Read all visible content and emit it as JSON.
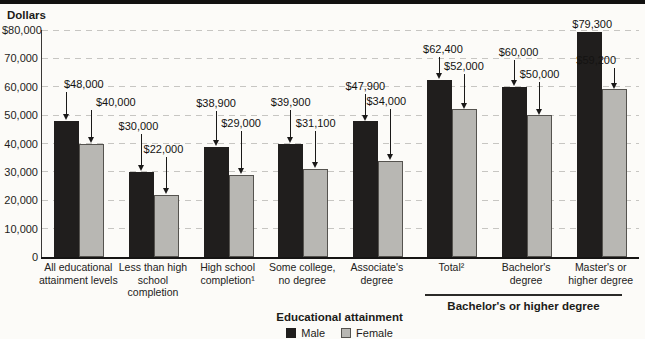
{
  "chart_data": {
    "type": "bar",
    "title": "",
    "ylabel": "Dollars",
    "xlabel": "Educational attainment",
    "ylim": [
      0,
      80000
    ],
    "grid": "horizontal-dashed",
    "legend_position": "bottom",
    "y_ticks": [
      {
        "label": "$80,000",
        "value": 80000
      },
      {
        "label": "70,000",
        "value": 70000
      },
      {
        "label": "60,000",
        "value": 60000
      },
      {
        "label": "50,000",
        "value": 50000
      },
      {
        "label": "40,000",
        "value": 40000
      },
      {
        "label": "30,000",
        "value": 30000
      },
      {
        "label": "20,000",
        "value": 20000
      },
      {
        "label": "10,000",
        "value": 10000
      },
      {
        "label": "0",
        "value": 0
      }
    ],
    "categories": [
      "All educational attainment levels",
      "Less than high school completion",
      "High school completion¹",
      "Some college, no degree",
      "Associate's degree",
      "Total²",
      "Bachelor's degree",
      "Master's or higher degree"
    ],
    "series": [
      {
        "name": "Male",
        "color": "#201e1d",
        "values": [
          48000,
          30000,
          38900,
          39900,
          47900,
          62400,
          60000,
          79300
        ],
        "value_labels": [
          "$48,000",
          "$30,000",
          "$38,900",
          "$39,900",
          "$47,900",
          "$62,400",
          "$60,000",
          "$79,300"
        ]
      },
      {
        "name": "Female",
        "color": "#b8b7b3",
        "values": [
          40000,
          22000,
          29000,
          31100,
          34000,
          52000,
          50000,
          59200
        ],
        "value_labels": [
          "$40,000",
          "$22,000",
          "$29,000",
          "$31,100",
          "$34,000",
          "$52,000",
          "$50,000",
          "$59,200"
        ]
      }
    ],
    "annotation": {
      "label": "Bachelor's or higher degree",
      "span_categories": [
        "Total²",
        "Bachelor's degree",
        "Master's or higher degree"
      ]
    }
  },
  "legend": {
    "title": "Educational attainment",
    "items": [
      {
        "label": "Male",
        "color": "#201e1d"
      },
      {
        "label": "Female",
        "color": "#b8b7b3"
      }
    ]
  }
}
